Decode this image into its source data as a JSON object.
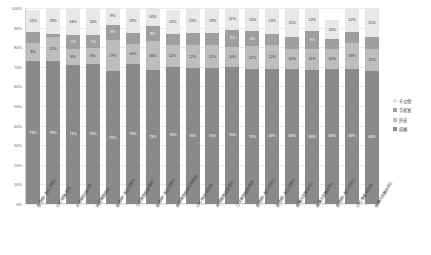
{
  "chart_data": {
    "type": "bar",
    "stacked": true,
    "stack_mode": "percent",
    "title": "",
    "subtitle": "",
    "xlabel": "",
    "ylabel": "",
    "ylim": [
      0,
      100
    ],
    "grid": true,
    "legend_position": "right",
    "ytick_labels": [
      "100%",
      "90%",
      "80%",
      "70%",
      "60%",
      "50%",
      "40%",
      "30%",
      "20%",
      "10%",
      "0%"
    ],
    "ytick_values": [
      100,
      90,
      80,
      70,
      60,
      50,
      40,
      30,
      20,
      10,
      0
    ],
    "categories": [
      "急性期一般入院料1",
      "DPC標準病院",
      "大学病院本院群",
      "特定機能病院",
      "急性期一般入院料6",
      "三次救急医療機関",
      "急性期一般入院料5",
      "救命救急医療実施施設",
      "DPC特定病院群",
      "地域医療支援病院",
      "二次救急医療機関",
      "急性期一般入院料4",
      "急性期一般入院料3",
      "療養入院基本料1",
      "療養入院基本料2",
      "急性期一般入院料2",
      "DPC準備病院群",
      "療養入院基本料2"
    ],
    "series": [
      {
        "name": "病棟",
        "color": "#8a8a8a",
        "values": [
          73,
          73,
          71,
          73,
          71,
          73,
          73,
          70,
          70,
          70,
          70,
          70,
          69,
          69,
          69,
          69,
          69,
          68
        ]
      },
      {
        "name": "外来",
        "color": "#bdbdbd",
        "values": [
          9,
          12,
          8,
          8,
          17,
          10,
          16,
          11,
          12,
          12,
          10,
          12,
          12,
          10,
          11,
          10,
          13,
          11
        ]
      },
      {
        "name": "手術室",
        "color": "#9f9f9f",
        "values": [
          6,
          2,
          7,
          7,
          8,
          6,
          8,
          6,
          6,
          6,
          9,
          8,
          6,
          6,
          9,
          5,
          6,
          6
        ]
      },
      {
        "name": "その他",
        "color": "#e8e8e8",
        "values": [
          11,
          13,
          14,
          14,
          9,
          13,
          10,
          12,
          13,
          13,
          11,
          12,
          13,
          15,
          12,
          10,
          12,
          15
        ]
      }
    ],
    "legend": [
      {
        "label": "その他",
        "color": "#e8e8e8"
      },
      {
        "label": "手術室",
        "color": "#9f9f9f"
      },
      {
        "label": "外来",
        "color": "#bdbdbd"
      },
      {
        "label": "病棟",
        "color": "#8a8a8a"
      }
    ]
  }
}
